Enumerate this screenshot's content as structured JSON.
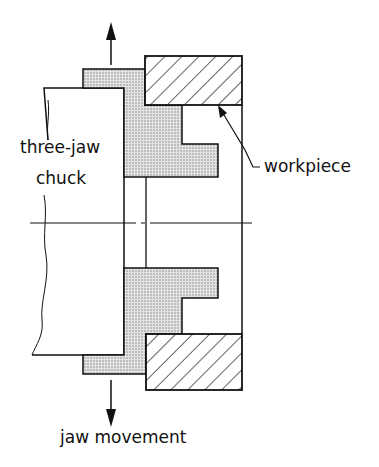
{
  "diagram": {
    "labels": {
      "chuck_line1": "three-jaw",
      "chuck_line2": "chuck",
      "workpiece": "workpiece",
      "jaw_movement": "jaw movement"
    },
    "colors": {
      "line": "#111111",
      "jaw_fill": "#d6d6d6",
      "background": "#ffffff"
    }
  }
}
